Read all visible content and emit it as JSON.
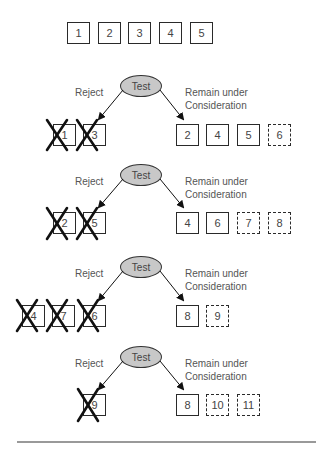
{
  "initial_set": [
    "1",
    "2",
    "3",
    "4",
    "5"
  ],
  "test_label": "Test",
  "reject_label": "Reject",
  "remain_label_line1": "Remain under",
  "remain_label_line2": "Consideration",
  "stages": [
    {
      "rejected": [
        "1",
        "3"
      ],
      "remaining": [
        {
          "value": "2",
          "new": false
        },
        {
          "value": "4",
          "new": false
        },
        {
          "value": "5",
          "new": false
        },
        {
          "value": "6",
          "new": true
        }
      ]
    },
    {
      "rejected": [
        "2",
        "5"
      ],
      "remaining": [
        {
          "value": "4",
          "new": false
        },
        {
          "value": "6",
          "new": false
        },
        {
          "value": "7",
          "new": true
        },
        {
          "value": "8",
          "new": true
        }
      ]
    },
    {
      "rejected": [
        "4",
        "7",
        "6"
      ],
      "remaining": [
        {
          "value": "8",
          "new": false
        },
        {
          "value": "9",
          "new": true
        }
      ]
    },
    {
      "rejected": [
        "9"
      ],
      "remaining": [
        {
          "value": "8",
          "new": false
        },
        {
          "value": "10",
          "new": true
        },
        {
          "value": "11",
          "new": true
        }
      ]
    }
  ],
  "colors": {
    "ellipse_fill": "#c8c8c8",
    "stroke": "#2a2a2a",
    "rule": "#999999"
  }
}
